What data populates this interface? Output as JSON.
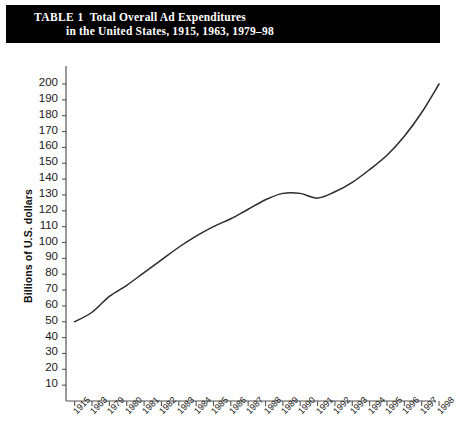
{
  "title": {
    "prefix": "TABLE 1",
    "line1": "Total Overall Ad Expenditures",
    "line2": "in the United States, 1915, 1963, 1979–98",
    "full": "TABLE 1  Total Overall Ad Expenditures in the United States, 1915, 1963, 1979–98",
    "background_color": "#000000",
    "text_color": "#ffffff"
  },
  "chart_data": {
    "type": "line",
    "title": "Total Overall Ad Expenditures in the United States, 1915, 1963, 1979–98",
    "xlabel": "",
    "ylabel": "Billions of U.S. dollars",
    "categories": [
      "1915",
      "1963",
      "1979",
      "1980",
      "1981",
      "1982",
      "1983",
      "1984",
      "1985",
      "1986",
      "1987",
      "1988",
      "1989",
      "1990",
      "1991",
      "1992",
      "1993",
      "1994",
      "1995",
      "1996",
      "1997",
      "1998"
    ],
    "values": [
      50,
      56,
      66,
      73,
      81,
      89,
      97,
      104,
      110,
      115,
      121,
      127,
      131,
      131,
      128,
      132,
      138,
      146,
      155,
      167,
      182,
      200
    ],
    "series": [
      {
        "name": "Total ad expenditures",
        "values": [
          50,
          56,
          66,
          73,
          81,
          89,
          97,
          104,
          110,
          115,
          121,
          127,
          131,
          131,
          128,
          132,
          138,
          146,
          155,
          167,
          182,
          200
        ]
      }
    ],
    "ylim": [
      0,
      200
    ],
    "ytick_values": [
      10,
      20,
      30,
      40,
      50,
      60,
      70,
      80,
      90,
      100,
      110,
      120,
      130,
      140,
      150,
      160,
      170,
      180,
      190,
      200
    ],
    "ytick_labels": [
      "10",
      "20",
      "30",
      "40",
      "50",
      "60",
      "70",
      "80",
      "90",
      "100",
      "110",
      "120",
      "130",
      "140",
      "150",
      "160",
      "170",
      "180",
      "190",
      "200"
    ],
    "xtick_labels": [
      "1915",
      "1963",
      "1979",
      "1980",
      "1981",
      "1982",
      "1983",
      "1984",
      "1985",
      "1986",
      "1987",
      "1988",
      "1989",
      "1990",
      "1991",
      "1992",
      "1993",
      "1994",
      "1995",
      "1996",
      "1997",
      "1998"
    ],
    "grid": false,
    "legend": "none",
    "line_color": "#2b2b2b",
    "axis_color": "#555555"
  }
}
